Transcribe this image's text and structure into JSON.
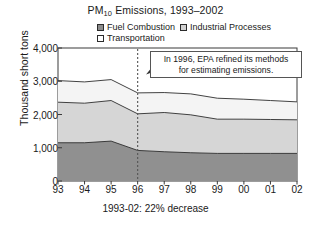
{
  "title": {
    "main": "PM",
    "sub": "10",
    "rest": " Emissions, 1993–2002"
  },
  "title_full": "PM10 Emissions, 1993–2002",
  "legend": [
    {
      "label": "Fuel Combustion",
      "color": "#8c8c8c",
      "key": "fuel"
    },
    {
      "label": "Industrial Processes",
      "color": "#d2d2d2",
      "key": "indus"
    },
    {
      "label": "Transportation",
      "color": "#ffffff",
      "key": "trans"
    }
  ],
  "axis": {
    "ylabel": "Thousand short tons",
    "yticks": [
      "0",
      "1,000",
      "2,000",
      "3,000",
      "4,000"
    ],
    "xticks": [
      "93",
      "94",
      "95",
      "96",
      "97",
      "98",
      "99",
      "00",
      "01",
      "02"
    ]
  },
  "annotation": {
    "line1": "In 1996, EPA refined its methods",
    "line2": "for estimating emissions."
  },
  "caption": "1993-02: 22% decrease",
  "chart_data": {
    "type": "area",
    "title": "PM10 Emissions, 1993–2002",
    "xlabel": "",
    "ylabel": "Thousand short tons",
    "categories": [
      "93",
      "94",
      "95",
      "96",
      "97",
      "98",
      "99",
      "00",
      "01",
      "02"
    ],
    "ylim": [
      0,
      4000
    ],
    "yticks": [
      0,
      1000,
      2000,
      3000,
      4000
    ],
    "grid": false,
    "legend_position": "top",
    "stacked": true,
    "series": [
      {
        "name": "Fuel Combustion",
        "color": "#8c8c8c",
        "values": [
          1150,
          1150,
          1200,
          920,
          880,
          850,
          830,
          830,
          830,
          830
        ]
      },
      {
        "name": "Industrial Processes",
        "color": "#d2d2d2",
        "values": [
          1220,
          1190,
          1220,
          1100,
          1180,
          1140,
          1030,
          1030,
          1020,
          1010
        ]
      },
      {
        "name": "Transportation",
        "color": "#f2f2f2",
        "values": [
          650,
          640,
          630,
          630,
          600,
          630,
          630,
          600,
          570,
          540
        ]
      }
    ],
    "cumulative": {
      "fuel": [
        1150,
        1150,
        1200,
        920,
        880,
        850,
        830,
        830,
        830,
        830
      ],
      "indus": [
        2370,
        2340,
        2420,
        2020,
        2060,
        1990,
        1860,
        1860,
        1850,
        1840
      ],
      "trans": [
        3020,
        2980,
        3050,
        2650,
        2660,
        2620,
        2490,
        2460,
        2420,
        2380
      ]
    },
    "annotations": [
      {
        "text": "In 1996, EPA refined its methods for estimating emissions.",
        "x": "96"
      }
    ],
    "marker_line": {
      "x": "96",
      "style": "dotted"
    },
    "footnote": "1993-02: 22% decrease"
  }
}
